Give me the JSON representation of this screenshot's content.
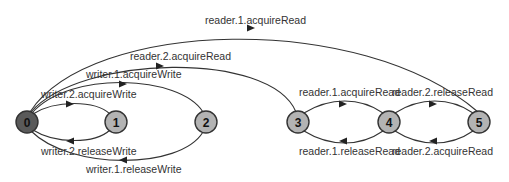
{
  "diagram": {
    "type": "state-transition-diagram",
    "colors": {
      "initial_node_fill": "#5a5a5a",
      "node_fill": "#b3b3b3",
      "edge_stroke": "#333333",
      "text": "#333333"
    },
    "nodes": [
      {
        "id": "0",
        "label": "0",
        "initial": true
      },
      {
        "id": "1",
        "label": "1"
      },
      {
        "id": "2",
        "label": "2"
      },
      {
        "id": "3",
        "label": "3"
      },
      {
        "id": "4",
        "label": "4"
      },
      {
        "id": "5",
        "label": "5"
      }
    ],
    "edges": [
      {
        "from": "0",
        "to": "5",
        "label": "reader.1.acquireRead"
      },
      {
        "from": "0",
        "to": "3",
        "label": "reader.2.acquireRead"
      },
      {
        "from": "0",
        "to": "2",
        "label": "writer.1.acquireWrite"
      },
      {
        "from": "0",
        "to": "1",
        "label": "writer.2.acquireWrite"
      },
      {
        "from": "1",
        "to": "0",
        "label": "writer.2.releaseWrite"
      },
      {
        "from": "2",
        "to": "0",
        "label": "writer.1.releaseWrite"
      },
      {
        "from": "3",
        "to": "4",
        "label": "reader.1.acquireRead"
      },
      {
        "from": "4",
        "to": "3",
        "label": "reader.1.releaseRead"
      },
      {
        "from": "4",
        "to": "5",
        "label": "reader.2.releaseRead"
      },
      {
        "from": "5",
        "to": "4",
        "label": "reader.2.acquireRead"
      }
    ]
  }
}
